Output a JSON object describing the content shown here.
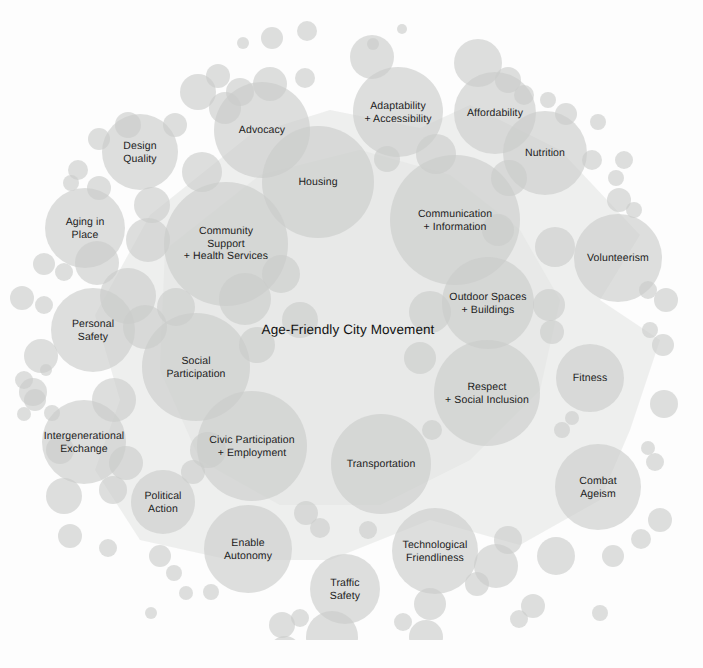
{
  "figure": {
    "center_label": "Age-Friendly City\nMovement",
    "caption": "",
    "ghost_text": "",
    "background_color": "#ffffff",
    "bubble_color": "#c9cbc9",
    "bubble_opacity": 0.62,
    "polygon_color": "#e2e3e2",
    "label_color": "#1c1c1c"
  },
  "chart_data": {
    "type": "bubble",
    "title": "Age-Friendly City Movement",
    "xlabel": "",
    "ylabel": "",
    "legend": [],
    "grid": false,
    "center": {
      "label": "Age-Friendly City Movement",
      "x": 348,
      "y": 330
    },
    "nodes": [
      {
        "label": "Design\nQuality",
        "x": 140,
        "y": 152,
        "r": 38,
        "labeled": true
      },
      {
        "label": "Advocacy",
        "x": 262,
        "y": 130,
        "r": 48,
        "labeled": true
      },
      {
        "label": "Adaptability\n+ Accessibility",
        "x": 398,
        "y": 112,
        "r": 45,
        "labeled": true
      },
      {
        "label": "Affordability",
        "x": 495,
        "y": 113,
        "r": 41,
        "labeled": true
      },
      {
        "label": "Nutrition",
        "x": 545,
        "y": 153,
        "r": 42,
        "labeled": true
      },
      {
        "label": "Housing",
        "x": 318,
        "y": 182,
        "r": 56,
        "labeled": true
      },
      {
        "label": "Aging in\nPlace",
        "x": 85,
        "y": 228,
        "r": 40,
        "labeled": true
      },
      {
        "label": "Community\nSupport\n+ Health Services",
        "x": 226,
        "y": 244,
        "r": 62,
        "labeled": true
      },
      {
        "label": "Communication\n+ Information",
        "x": 455,
        "y": 220,
        "r": 65,
        "labeled": true
      },
      {
        "label": "Volunteerism",
        "x": 618,
        "y": 258,
        "r": 44,
        "labeled": true
      },
      {
        "label": "Outdoor Spaces\n+ Buildings",
        "x": 488,
        "y": 303,
        "r": 46,
        "labeled": true
      },
      {
        "label": "Personal\nSafety",
        "x": 93,
        "y": 330,
        "r": 42,
        "labeled": true
      },
      {
        "label": "Social\nParticipation",
        "x": 196,
        "y": 367,
        "r": 54,
        "labeled": true
      },
      {
        "label": "Respect\n+ Social Inclusion",
        "x": 487,
        "y": 393,
        "r": 53,
        "labeled": true
      },
      {
        "label": "Fitness",
        "x": 590,
        "y": 378,
        "r": 34,
        "labeled": true
      },
      {
        "label": "Intergenerational\nExchange",
        "x": 84,
        "y": 442,
        "r": 42,
        "labeled": true
      },
      {
        "label": "Civic Participation\n+ Employment",
        "x": 252,
        "y": 446,
        "r": 55,
        "labeled": true
      },
      {
        "label": "Transportation",
        "x": 381,
        "y": 464,
        "r": 50,
        "labeled": true
      },
      {
        "label": "Combat\nAgeism",
        "x": 598,
        "y": 487,
        "r": 43,
        "labeled": true
      },
      {
        "label": "Political\nAction",
        "x": 163,
        "y": 502,
        "r": 32,
        "labeled": true
      },
      {
        "label": "Enable\nAutonomy",
        "x": 248,
        "y": 549,
        "r": 44,
        "labeled": true
      },
      {
        "label": "Technological\nFriendliness",
        "x": 435,
        "y": 551,
        "r": 43,
        "labeled": true
      },
      {
        "label": "Traffic\nSafety",
        "x": 345,
        "y": 589,
        "r": 35,
        "labeled": true
      },
      {
        "label": "",
        "x": 272,
        "y": 38,
        "r": 11,
        "labeled": false
      },
      {
        "label": "",
        "x": 307,
        "y": 31,
        "r": 10,
        "labeled": false
      },
      {
        "label": "",
        "x": 402,
        "y": 29,
        "r": 5,
        "labeled": false
      },
      {
        "label": "",
        "x": 372,
        "y": 57,
        "r": 22,
        "labeled": false
      },
      {
        "label": "",
        "x": 373,
        "y": 44,
        "r": 6,
        "labeled": false
      },
      {
        "label": "",
        "x": 478,
        "y": 63,
        "r": 24,
        "labeled": false
      },
      {
        "label": "",
        "x": 508,
        "y": 80,
        "r": 13,
        "labeled": false
      },
      {
        "label": "",
        "x": 524,
        "y": 95,
        "r": 10,
        "labeled": false
      },
      {
        "label": "",
        "x": 198,
        "y": 92,
        "r": 18,
        "labeled": false
      },
      {
        "label": "",
        "x": 218,
        "y": 76,
        "r": 12,
        "labeled": false
      },
      {
        "label": "",
        "x": 240,
        "y": 92,
        "r": 14,
        "labeled": false
      },
      {
        "label": "",
        "x": 270,
        "y": 84,
        "r": 17,
        "labeled": false
      },
      {
        "label": "",
        "x": 305,
        "y": 78,
        "r": 10,
        "labeled": false
      },
      {
        "label": "",
        "x": 128,
        "y": 125,
        "r": 13,
        "labeled": false
      },
      {
        "label": "",
        "x": 99,
        "y": 139,
        "r": 11,
        "labeled": false
      },
      {
        "label": "",
        "x": 175,
        "y": 125,
        "r": 12,
        "labeled": false
      },
      {
        "label": "",
        "x": 225,
        "y": 108,
        "r": 16,
        "labeled": false
      },
      {
        "label": "",
        "x": 598,
        "y": 122,
        "r": 8,
        "labeled": false
      },
      {
        "label": "",
        "x": 624,
        "y": 160,
        "r": 9,
        "labeled": false
      },
      {
        "label": "",
        "x": 616,
        "y": 178,
        "r": 8,
        "labeled": false
      },
      {
        "label": "",
        "x": 78,
        "y": 170,
        "r": 10,
        "labeled": false
      },
      {
        "label": "",
        "x": 71,
        "y": 183,
        "r": 8,
        "labeled": false
      },
      {
        "label": "",
        "x": 99,
        "y": 188,
        "r": 12,
        "labeled": false
      },
      {
        "label": "",
        "x": 152,
        "y": 205,
        "r": 18,
        "labeled": false
      },
      {
        "label": "",
        "x": 202,
        "y": 172,
        "r": 20,
        "labeled": false
      },
      {
        "label": "",
        "x": 44,
        "y": 264,
        "r": 11,
        "labeled": false
      },
      {
        "label": "",
        "x": 64,
        "y": 272,
        "r": 9,
        "labeled": false
      },
      {
        "label": "",
        "x": 22,
        "y": 298,
        "r": 12,
        "labeled": false
      },
      {
        "label": "",
        "x": 44,
        "y": 305,
        "r": 9,
        "labeled": false
      },
      {
        "label": "",
        "x": 41,
        "y": 356,
        "r": 17,
        "labeled": false
      },
      {
        "label": "",
        "x": 33,
        "y": 392,
        "r": 14,
        "labeled": false
      },
      {
        "label": "",
        "x": 24,
        "y": 380,
        "r": 9,
        "labeled": false
      },
      {
        "label": "",
        "x": 148,
        "y": 240,
        "r": 22,
        "labeled": false
      },
      {
        "label": "",
        "x": 128,
        "y": 296,
        "r": 28,
        "labeled": false
      },
      {
        "label": "",
        "x": 145,
        "y": 327,
        "r": 22,
        "labeled": false
      },
      {
        "label": "",
        "x": 176,
        "y": 307,
        "r": 19,
        "labeled": false
      },
      {
        "label": "",
        "x": 35,
        "y": 400,
        "r": 11,
        "labeled": false
      },
      {
        "label": "",
        "x": 24,
        "y": 414,
        "r": 7,
        "labeled": false
      },
      {
        "label": "",
        "x": 52,
        "y": 413,
        "r": 8,
        "labeled": false
      },
      {
        "label": "",
        "x": 46,
        "y": 370,
        "r": 6,
        "labeled": false
      },
      {
        "label": "",
        "x": 114,
        "y": 400,
        "r": 22,
        "labeled": false
      },
      {
        "label": "",
        "x": 126,
        "y": 463,
        "r": 17,
        "labeled": false
      },
      {
        "label": "",
        "x": 113,
        "y": 490,
        "r": 14,
        "labeled": false
      },
      {
        "label": "",
        "x": 64,
        "y": 496,
        "r": 18,
        "labeled": false
      },
      {
        "label": "",
        "x": 70,
        "y": 536,
        "r": 12,
        "labeled": false
      },
      {
        "label": "",
        "x": 108,
        "y": 548,
        "r": 9,
        "labeled": false
      },
      {
        "label": "",
        "x": 160,
        "y": 556,
        "r": 11,
        "labeled": false
      },
      {
        "label": "",
        "x": 174,
        "y": 573,
        "r": 8,
        "labeled": false
      },
      {
        "label": "",
        "x": 186,
        "y": 593,
        "r": 7,
        "labeled": false
      },
      {
        "label": "",
        "x": 151,
        "y": 613,
        "r": 6,
        "labeled": false
      },
      {
        "label": "",
        "x": 282,
        "y": 625,
        "r": 13,
        "labeled": false
      },
      {
        "label": "",
        "x": 285,
        "y": 652,
        "r": 16,
        "labeled": false
      },
      {
        "label": "",
        "x": 300,
        "y": 618,
        "r": 9,
        "labeled": false
      },
      {
        "label": "",
        "x": 332,
        "y": 637,
        "r": 26,
        "labeled": false
      },
      {
        "label": "",
        "x": 403,
        "y": 622,
        "r": 9,
        "labeled": false
      },
      {
        "label": "",
        "x": 426,
        "y": 637,
        "r": 17,
        "labeled": false
      },
      {
        "label": "",
        "x": 430,
        "y": 604,
        "r": 16,
        "labeled": false
      },
      {
        "label": "",
        "x": 477,
        "y": 584,
        "r": 12,
        "labeled": false
      },
      {
        "label": "",
        "x": 496,
        "y": 566,
        "r": 22,
        "labeled": false
      },
      {
        "label": "",
        "x": 519,
        "y": 619,
        "r": 9,
        "labeled": false
      },
      {
        "label": "",
        "x": 533,
        "y": 606,
        "r": 12,
        "labeled": false
      },
      {
        "label": "",
        "x": 508,
        "y": 540,
        "r": 14,
        "labeled": false
      },
      {
        "label": "",
        "x": 556,
        "y": 556,
        "r": 19,
        "labeled": false
      },
      {
        "label": "",
        "x": 600,
        "y": 613,
        "r": 8,
        "labeled": false
      },
      {
        "label": "",
        "x": 613,
        "y": 556,
        "r": 11,
        "labeled": false
      },
      {
        "label": "",
        "x": 641,
        "y": 539,
        "r": 10,
        "labeled": false
      },
      {
        "label": "",
        "x": 660,
        "y": 520,
        "r": 12,
        "labeled": false
      },
      {
        "label": "",
        "x": 655,
        "y": 462,
        "r": 9,
        "labeled": false
      },
      {
        "label": "",
        "x": 648,
        "y": 448,
        "r": 7,
        "labeled": false
      },
      {
        "label": "",
        "x": 562,
        "y": 430,
        "r": 8,
        "labeled": false
      },
      {
        "label": "",
        "x": 572,
        "y": 418,
        "r": 7,
        "labeled": false
      },
      {
        "label": "",
        "x": 664,
        "y": 404,
        "r": 14,
        "labeled": false
      },
      {
        "label": "",
        "x": 663,
        "y": 345,
        "r": 11,
        "labeled": false
      },
      {
        "label": "",
        "x": 650,
        "y": 330,
        "r": 8,
        "labeled": false
      },
      {
        "label": "",
        "x": 666,
        "y": 300,
        "r": 12,
        "labeled": false
      },
      {
        "label": "",
        "x": 648,
        "y": 290,
        "r": 9,
        "labeled": false
      },
      {
        "label": "",
        "x": 634,
        "y": 210,
        "r": 8,
        "labeled": false
      },
      {
        "label": "",
        "x": 619,
        "y": 200,
        "r": 12,
        "labeled": false
      },
      {
        "label": "",
        "x": 592,
        "y": 160,
        "r": 10,
        "labeled": false
      },
      {
        "label": "",
        "x": 566,
        "y": 114,
        "r": 11,
        "labeled": false
      },
      {
        "label": "",
        "x": 548,
        "y": 100,
        "r": 8,
        "labeled": false
      },
      {
        "label": "",
        "x": 436,
        "y": 154,
        "r": 20,
        "labeled": false
      },
      {
        "label": "",
        "x": 387,
        "y": 159,
        "r": 13,
        "labeled": false
      },
      {
        "label": "",
        "x": 509,
        "y": 178,
        "r": 18,
        "labeled": false
      },
      {
        "label": "",
        "x": 498,
        "y": 230,
        "r": 16,
        "labeled": false
      },
      {
        "label": "",
        "x": 555,
        "y": 247,
        "r": 20,
        "labeled": false
      },
      {
        "label": "",
        "x": 549,
        "y": 305,
        "r": 16,
        "labeled": false
      },
      {
        "label": "",
        "x": 552,
        "y": 332,
        "r": 12,
        "labeled": false
      },
      {
        "label": "",
        "x": 430,
        "y": 312,
        "r": 21,
        "labeled": false
      },
      {
        "label": "",
        "x": 420,
        "y": 358,
        "r": 16,
        "labeled": false
      },
      {
        "label": "",
        "x": 432,
        "y": 430,
        "r": 10,
        "labeled": false
      },
      {
        "label": "",
        "x": 245,
        "y": 299,
        "r": 26,
        "labeled": false
      },
      {
        "label": "",
        "x": 257,
        "y": 345,
        "r": 18,
        "labeled": false
      },
      {
        "label": "",
        "x": 281,
        "y": 274,
        "r": 19,
        "labeled": false
      },
      {
        "label": "",
        "x": 300,
        "y": 320,
        "r": 18,
        "labeled": false
      },
      {
        "label": "",
        "x": 208,
        "y": 450,
        "r": 18,
        "labeled": false
      },
      {
        "label": "",
        "x": 193,
        "y": 472,
        "r": 12,
        "labeled": false
      },
      {
        "label": "",
        "x": 306,
        "y": 513,
        "r": 12,
        "labeled": false
      },
      {
        "label": "",
        "x": 320,
        "y": 528,
        "r": 10,
        "labeled": false
      },
      {
        "label": "",
        "x": 211,
        "y": 592,
        "r": 8,
        "labeled": false
      },
      {
        "label": "",
        "x": 368,
        "y": 530,
        "r": 9,
        "labeled": false
      },
      {
        "label": "",
        "x": 243,
        "y": 43,
        "r": 6,
        "labeled": false
      },
      {
        "label": "",
        "x": 97,
        "y": 263,
        "r": 22,
        "labeled": false
      },
      {
        "label": "",
        "x": 60,
        "y": 450,
        "r": 14,
        "labeled": false
      }
    ]
  }
}
